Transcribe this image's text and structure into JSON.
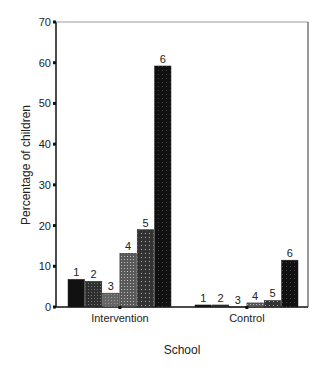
{
  "chart_data": {
    "type": "bar",
    "title": "",
    "xlabel": "School",
    "ylabel": "Percentage of children",
    "ylim": [
      0,
      70
    ],
    "yticks": [
      0,
      10,
      20,
      30,
      40,
      50,
      60,
      70
    ],
    "grid": false,
    "legend": "none",
    "categories": [
      "Intervention",
      "Control"
    ],
    "series": [
      {
        "name": "1",
        "values": [
          6.8,
          0.5
        ],
        "color": "#111111"
      },
      {
        "name": "2",
        "values": [
          6.3,
          0.5
        ],
        "color": "#3a3a3a"
      },
      {
        "name": "3",
        "values": [
          3.4,
          0.1
        ],
        "color": "#6a6a6a"
      },
      {
        "name": "4",
        "values": [
          13.2,
          1.0
        ],
        "color": "#7e7e7e"
      },
      {
        "name": "5",
        "values": [
          19.0,
          1.6
        ],
        "color": "#4a4a4a"
      },
      {
        "name": "6",
        "values": [
          59.2,
          11.5
        ],
        "color": "#141414"
      }
    ]
  }
}
